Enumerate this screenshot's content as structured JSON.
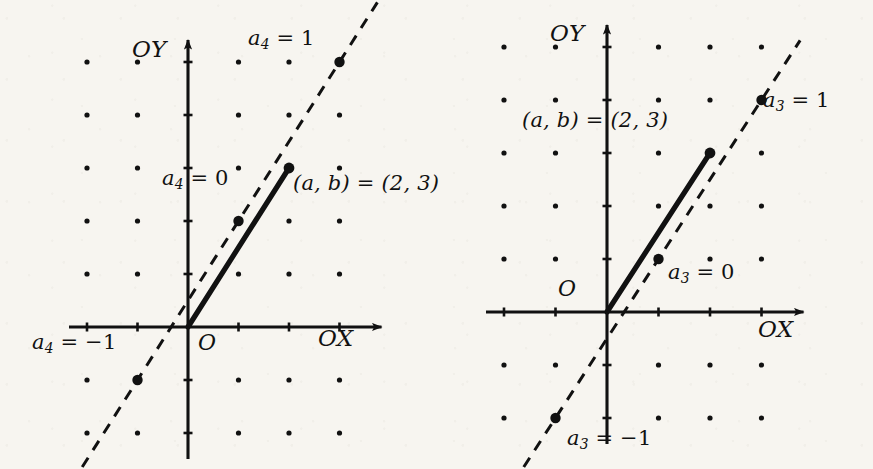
{
  "page": {
    "width": 873,
    "height": 469,
    "background_color": "#f7f5f0",
    "ink_color": "#111111"
  },
  "figures": [
    {
      "id": "left",
      "name": "lattice-diagram-a4",
      "origin_px": {
        "x": 188,
        "y": 327
      },
      "unit_px": {
        "x": 50.5,
        "y": 53.0
      },
      "axis_x_label": "OX",
      "axis_y_label": "OY",
      "origin_label": "O",
      "vector_label": "(a, b) = (2, 3)",
      "vector_point": {
        "x": 2,
        "y": 3
      },
      "dashed_line": {
        "slope": 1.5,
        "intercept": 0.5
      },
      "marked_points": [
        {
          "x": 3,
          "y": 5,
          "label_main": "a",
          "label_sub": "4",
          "label_value": "= 1"
        },
        {
          "x": 1,
          "y": 2,
          "label_main": "a",
          "label_sub": "4",
          "label_value": "= 0"
        },
        {
          "x": -1,
          "y": -1,
          "label_main": "a",
          "label_sub": "4",
          "label_value": "= −1"
        }
      ],
      "lattice_cols": [
        -2,
        -1,
        0,
        1,
        2,
        3
      ],
      "lattice_rows": [
        -2,
        -1,
        0,
        1,
        2,
        3,
        4,
        5
      ]
    },
    {
      "id": "right",
      "name": "lattice-diagram-a3",
      "origin_px": {
        "x": 167,
        "y": 312
      },
      "unit_px": {
        "x": 51.5,
        "y": 53.0
      },
      "axis_x_label": "OX",
      "axis_y_label": "OY",
      "origin_label": "O",
      "vector_label": "(a, b) = (2, 3)",
      "vector_point": {
        "x": 2,
        "y": 3
      },
      "dashed_line": {
        "slope": 1.5,
        "intercept": -0.5
      },
      "marked_points": [
        {
          "x": 3,
          "y": 4,
          "label_main": "a",
          "label_sub": "3",
          "label_value": "= 1"
        },
        {
          "x": 1,
          "y": 1,
          "label_main": "a",
          "label_sub": "3",
          "label_value": "= 0"
        },
        {
          "x": -1,
          "y": -2,
          "label_main": "a",
          "label_sub": "3",
          "label_value": "= −1"
        }
      ],
      "lattice_cols": [
        -2,
        -1,
        0,
        1,
        2,
        3
      ],
      "lattice_rows": [
        -2,
        -1,
        0,
        1,
        2,
        3,
        4,
        5
      ]
    }
  ],
  "labels": {
    "left": {
      "a4_eq_1": {
        "main": "a",
        "sub": "4",
        "rest": " = 1",
        "x": 248,
        "y": 28
      },
      "a4_eq_0": {
        "main": "a",
        "sub": "4",
        "rest": " = 0",
        "x": 162,
        "y": 168
      },
      "a4_eq_m1": {
        "main": "a",
        "sub": "4",
        "rest": " = −1",
        "x": 32,
        "y": 332
      },
      "ab_eq": {
        "text": "(a, b) = (2, 3)",
        "x": 293,
        "y": 173
      },
      "ox": {
        "text": "OX",
        "x": 318,
        "y": 327
      },
      "oy": {
        "text": "OY",
        "x": 132,
        "y": 38
      },
      "origin": {
        "text": "O",
        "x": 198,
        "y": 332
      }
    },
    "right": {
      "a3_eq_1": {
        "main": "a",
        "sub": "3",
        "rest": " = 1",
        "x": 323,
        "y": 90
      },
      "a3_eq_0": {
        "main": "a",
        "sub": "3",
        "rest": " = 0",
        "x": 228,
        "y": 262
      },
      "a3_eq_m1": {
        "main": "a",
        "sub": "3",
        "rest": " = −1",
        "x": 127,
        "y": 428
      },
      "ab_eq": {
        "text": "(a, b) = (2, 3)",
        "x": 82,
        "y": 110
      },
      "ox": {
        "text": "OX",
        "x": 318,
        "y": 318
      },
      "oy": {
        "text": "OY",
        "x": 110,
        "y": 22
      },
      "origin": {
        "text": "O",
        "x": 118,
        "y": 278
      }
    }
  },
  "chart_data": {
    "type": "scatter",
    "title": "",
    "xlabel": "OX",
    "ylabel": "OY",
    "panels": [
      {
        "name": "left-panel-a4",
        "coefficient_symbol": "a_4",
        "vector": {
          "x": 2,
          "y": 3
        },
        "dashed_line_points": [
          {
            "x": 3,
            "y": 5,
            "coefficient": 1
          },
          {
            "x": 1,
            "y": 2,
            "coefficient": 0
          },
          {
            "x": -1,
            "y": -1,
            "coefficient": -1
          }
        ],
        "dashed_line_equation": "y = 1.5x + 0.5",
        "xlim": [
          -2.6,
          3.8
        ],
        "ylim": [
          -2.4,
          5.6
        ],
        "grid": "lattice-dots"
      },
      {
        "name": "right-panel-a3",
        "coefficient_symbol": "a_3",
        "vector": {
          "x": 2,
          "y": 3
        },
        "dashed_line_points": [
          {
            "x": 3,
            "y": 4,
            "coefficient": 1
          },
          {
            "x": 1,
            "y": 1,
            "coefficient": 0
          },
          {
            "x": -1,
            "y": -2,
            "coefficient": -1
          }
        ],
        "dashed_line_equation": "y = 1.5x - 0.5",
        "xlim": [
          -2.4,
          3.9
        ],
        "ylim": [
          -2.9,
          5.3
        ],
        "grid": "lattice-dots"
      }
    ]
  }
}
